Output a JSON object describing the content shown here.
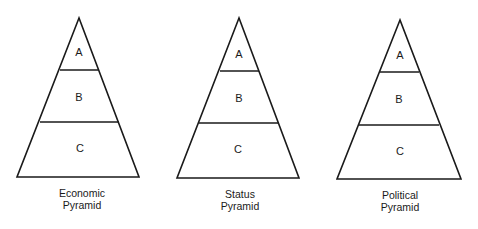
{
  "pyramids": [
    {
      "id": "economic",
      "caption_line1": "Economic",
      "caption_line2": "Pyramid",
      "tiers": [
        "A",
        "B",
        "C"
      ]
    },
    {
      "id": "status",
      "caption_line1": "Status",
      "caption_line2": "Pyramid",
      "tiers": [
        "A",
        "B",
        "C"
      ]
    },
    {
      "id": "political",
      "caption_line1": "Political",
      "caption_line2": "Pyramid",
      "tiers": [
        "A",
        "B",
        "C"
      ]
    }
  ],
  "colors": {
    "line": "#1a1a1a",
    "background": "#ffffff"
  }
}
